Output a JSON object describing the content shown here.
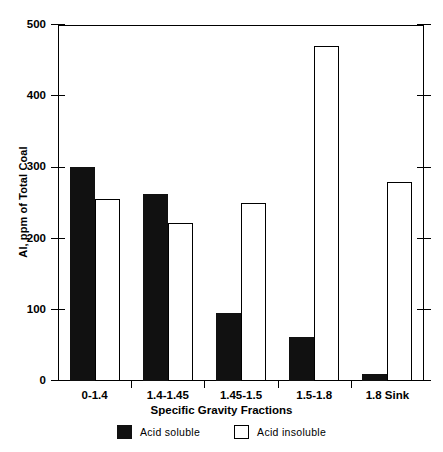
{
  "chart_data": {
    "type": "bar",
    "title": "",
    "xlabel": "Specific Gravity Fractions",
    "ylabel": "Al, ppm of Total Coal",
    "categories": [
      "0-1.4",
      "1.4-1.45",
      "1.45-1.5",
      "1.5-1.8",
      "1.8 Sink"
    ],
    "series": [
      {
        "name": "Acid soluble",
        "values": [
          300,
          262,
          95,
          62,
          10
        ],
        "color": "#111111",
        "style": "filled"
      },
      {
        "name": "Acid insoluble",
        "values": [
          255,
          222,
          250,
          470,
          280
        ],
        "color": "#ffffff",
        "style": "outlined"
      }
    ],
    "ylim": [
      0,
      500
    ],
    "ytick_values": [
      0,
      100,
      200,
      300,
      400,
      500
    ],
    "ytick_labels": [
      "0",
      "100",
      "200",
      "300",
      "400",
      "500"
    ],
    "grid": false,
    "legend_position": "bottom"
  },
  "legend": {
    "items": [
      {
        "label": "Acid soluble",
        "style": "solid"
      },
      {
        "label": "Acid insoluble",
        "style": "hollow"
      }
    ]
  }
}
